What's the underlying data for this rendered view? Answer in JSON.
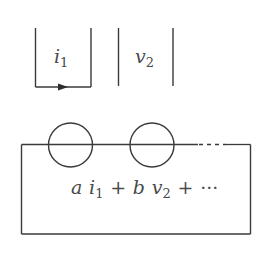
{
  "diagram": {
    "type": "circuit-schematic",
    "colors": {
      "stroke": "#3a3a3a",
      "text": "#4a4a4a",
      "background": "#ffffff"
    },
    "current_probe": {
      "label_var": "i",
      "label_sub": "1",
      "arrow_direction": "right"
    },
    "voltage_probe": {
      "label_var": "v",
      "label_sub": "2"
    },
    "network_box": {
      "elements": [
        {
          "type": "circle",
          "index": 1
        },
        {
          "type": "circle",
          "index": 2
        }
      ],
      "continuation": "dashed",
      "expression": {
        "t1_coef": "a",
        "t1_var": "i",
        "t1_sub": "1",
        "plus1": "+",
        "t2_coef": "b",
        "t2_var": "v",
        "t2_sub": "2",
        "plus2": "+",
        "ellipsis": "···"
      }
    }
  }
}
